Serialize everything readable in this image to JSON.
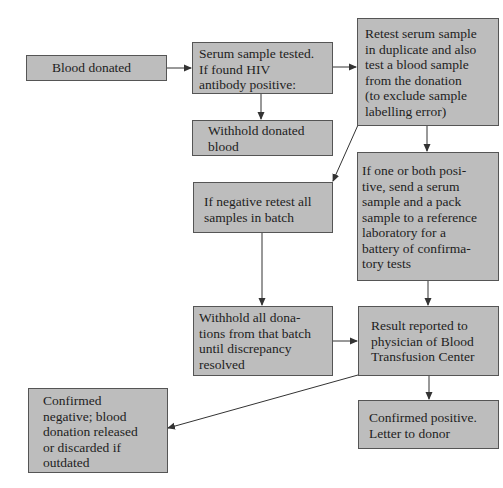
{
  "colors": {
    "box_fill": "#bdbdbd",
    "box_border": "#555555",
    "text": "#1e1e1e",
    "arrow": "#333333",
    "background": "#ffffff"
  },
  "nodes": {
    "blood_donated": {
      "text": "Blood donated"
    },
    "serum_tested": {
      "text": "Serum sample tested.\nIf found HIV\nantibody positive:"
    },
    "withhold_donated": {
      "text": "Withhold donated\nblood"
    },
    "retest_serum": {
      "text": "Retest serum sample\nin duplicate and also\ntest a blood sample\nfrom the donation\n(to exclude sample\nlabelling error)"
    },
    "one_or_both_positive": {
      "text": "If one or both posi-\ntive, send a serum\nsample and a pack\nsample to a reference\nlaboratory for a\nbattery of confirma-\ntory tests"
    },
    "negative_retest_batch": {
      "text": "If negative retest all\nsamples in batch"
    },
    "withhold_batch": {
      "text": "Withhold all dona-\ntions from that batch\nuntil discrepancy\nresolved"
    },
    "result_reported": {
      "text": "Result reported to\nphysician of Blood\nTransfusion Center"
    },
    "confirmed_negative": {
      "text": "Confirmed\nnegative; blood\ndonation released\nor discarded if\noutdated"
    },
    "confirmed_positive": {
      "text": "Confirmed positive.\nLetter to donor"
    }
  },
  "edges": [
    {
      "from": "blood_donated",
      "to": "serum_tested"
    },
    {
      "from": "serum_tested",
      "to": "withhold_donated"
    },
    {
      "from": "serum_tested",
      "to": "retest_serum"
    },
    {
      "from": "retest_serum",
      "to": "one_or_both_positive"
    },
    {
      "from": "retest_serum",
      "to": "negative_retest_batch"
    },
    {
      "from": "negative_retest_batch",
      "to": "withhold_batch"
    },
    {
      "from": "one_or_both_positive",
      "to": "result_reported"
    },
    {
      "from": "withhold_batch",
      "to": "result_reported"
    },
    {
      "from": "result_reported",
      "to": "confirmed_positive"
    },
    {
      "from": "result_reported",
      "to": "confirmed_negative"
    }
  ]
}
